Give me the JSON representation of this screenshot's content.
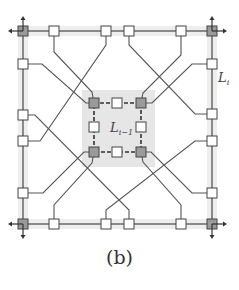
{
  "figure": {
    "caption": "(b)",
    "outer_label": "L",
    "outer_label_sub": "i",
    "inner_label": "L",
    "inner_label_sub": "i−1"
  },
  "colors": {
    "line": "#555555",
    "node_fill": "#ffffff",
    "corner_fill": "#9a9a9a",
    "inner_shade": "#e6e6e6",
    "outer_shade": "#eeeeee"
  },
  "outer_square": {
    "x1": 23,
    "y1": 31,
    "x2": 212,
    "y2": 224
  },
  "inner_square": {
    "x1": 94,
    "y1": 103,
    "x2": 141,
    "y2": 152,
    "shade": [
      82,
      90,
      155,
      167
    ]
  },
  "outer_nodes": {
    "top": [
      54,
      106,
      129,
      181
    ],
    "bottom": [
      54,
      106,
      129,
      181
    ],
    "left": [
      64,
      115,
      141,
      193
    ],
    "right": [
      64,
      114,
      141,
      193
    ]
  },
  "inner_nodes": [
    [
      117,
      103
    ],
    [
      94,
      127
    ],
    [
      141,
      127
    ],
    [
      117,
      152
    ]
  ],
  "wires": [
    [
      [
        54,
        31
      ],
      [
        54,
        52
      ],
      [
        92,
        92
      ],
      [
        94,
        103
      ]
    ],
    [
      [
        23,
        64
      ],
      [
        42,
        64
      ],
      [
        86,
        103
      ],
      [
        94,
        103
      ]
    ],
    [
      [
        181,
        31
      ],
      [
        181,
        55
      ],
      [
        143,
        93
      ],
      [
        141,
        103
      ]
    ],
    [
      [
        212,
        64
      ],
      [
        192,
        64
      ],
      [
        152,
        103
      ],
      [
        141,
        103
      ]
    ],
    [
      [
        23,
        193
      ],
      [
        43,
        193
      ],
      [
        84,
        152
      ],
      [
        94,
        152
      ]
    ],
    [
      [
        54,
        224
      ],
      [
        54,
        205
      ],
      [
        92,
        163
      ],
      [
        94,
        152
      ]
    ],
    [
      [
        212,
        193
      ],
      [
        192,
        193
      ],
      [
        151,
        152
      ],
      [
        141,
        152
      ]
    ],
    [
      [
        181,
        224
      ],
      [
        181,
        205
      ],
      [
        143,
        162
      ],
      [
        141,
        152
      ]
    ],
    [
      [
        106,
        31
      ],
      [
        106,
        45
      ],
      [
        40,
        141
      ],
      [
        23,
        141
      ]
    ],
    [
      [
        129,
        31
      ],
      [
        129,
        45
      ],
      [
        195,
        114
      ],
      [
        212,
        114
      ]
    ],
    [
      [
        23,
        115
      ],
      [
        35,
        115
      ],
      [
        129,
        210
      ],
      [
        129,
        224
      ]
    ],
    [
      [
        106,
        224
      ],
      [
        106,
        210
      ],
      [
        195,
        141
      ],
      [
        212,
        141
      ]
    ]
  ]
}
